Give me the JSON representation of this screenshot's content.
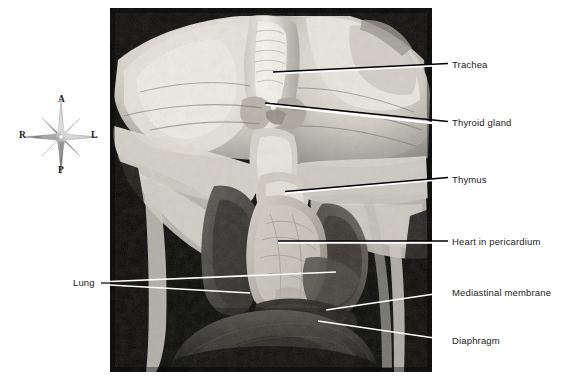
{
  "figure": {
    "kind": "anatomical-photograph",
    "background_color": "#ffffff",
    "photo_background_color": "#050505"
  },
  "compass": {
    "name": "orientation-compass",
    "anterior": "A",
    "posterior": "P",
    "right": "R",
    "left": "L"
  },
  "labels": {
    "trachea": "Trachea",
    "thyroid_gland": "Thyroid gland",
    "thymus": "Thymus",
    "heart_in_pericardium": "Heart in pericardium",
    "mediastinal_membrane": "Mediastinal membrane",
    "diaphragm": "Diaphragm",
    "lung": "Lung"
  },
  "leader_lines": {
    "stroke_dark": "#000000",
    "stroke_light": "#ffffff"
  }
}
